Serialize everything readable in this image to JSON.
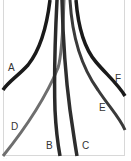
{
  "diagram": {
    "labels": {
      "A": "A",
      "B": "B",
      "C": "C",
      "D": "D",
      "E": "E",
      "F": "F"
    },
    "colors": {
      "dark": "#1a1a1a",
      "mid": "#3a3a3a",
      "gray": "#6e6e6e",
      "border": "#d8d8d8"
    },
    "caption": "· ·"
  }
}
